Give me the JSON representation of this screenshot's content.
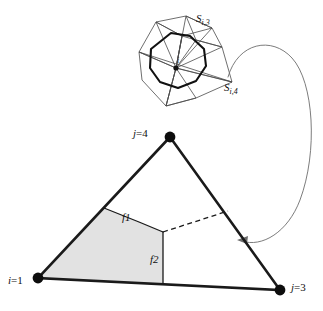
{
  "figure": {
    "type": "geometry-diagram",
    "background_color": "#ffffff",
    "line_color": "#1a1a1a",
    "thin_line_color": "#555555",
    "shade_color": "#e2e2e2",
    "arrow_color": "#666666"
  },
  "inset": {
    "name": "dual-cell-polyhedron",
    "center_label": "i",
    "labels": {
      "s_i3": {
        "base": "S",
        "sub": "i,3"
      },
      "s_i4": {
        "base": "S",
        "sub": "i,4"
      }
    }
  },
  "triangle": {
    "vertices": [
      {
        "id": "v-top",
        "label_base": "j",
        "label_eq": "=",
        "label_value": "4",
        "x": 170,
        "y": 137
      },
      {
        "id": "v-bottom-left",
        "label_base": "i",
        "label_eq": "=",
        "label_value": "1",
        "x": 38,
        "y": 278
      },
      {
        "id": "v-bottom-right",
        "label_base": "j",
        "label_eq": "=",
        "label_value": "3",
        "x": 280,
        "y": 290
      }
    ],
    "face_labels": {
      "f1": "f1",
      "f2": "f2"
    }
  },
  "annotations": {
    "curved_arrow": "points from dual cell inset to triangle right edge"
  }
}
